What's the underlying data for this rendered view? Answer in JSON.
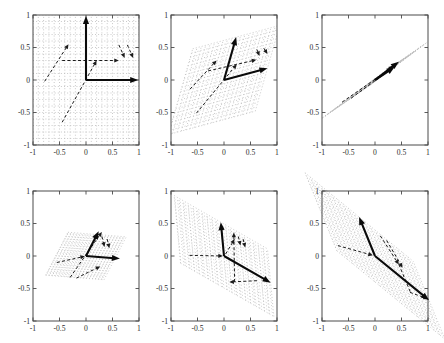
{
  "chart_data": {
    "type": "line",
    "title": "",
    "layout": {
      "rows": 2,
      "cols": 3
    },
    "xlim": [
      -1,
      1
    ],
    "ylim": [
      -1,
      1
    ],
    "grid": "dotted transformed lattice, spacing 0.1",
    "x_tick_labels": [
      "-1",
      "-0.5",
      "0",
      "0.5",
      "1"
    ],
    "y_tick_labels": [
      "-1",
      "-0.5",
      "0",
      "0.5",
      "1"
    ],
    "tick_values": [
      -1,
      -0.5,
      0,
      0.5,
      1
    ],
    "colors": {
      "axis": "#4a4a4a",
      "label": "#2a2a2a",
      "solid_vector": "#0a0a0a",
      "dashed_vector": "#1c1c1c",
      "grid_dots": "#bcbcbc",
      "background": "#ffffff"
    },
    "panels": [
      {
        "name": "identity-grid",
        "position": [
          11,
          7
        ],
        "grid_basis": [
          [
            1,
            0
          ],
          [
            0,
            1
          ]
        ],
        "grid_range": 1,
        "clip": true,
        "solid_vectors": [
          {
            "from": [
              0,
              0
            ],
            "to": [
              0,
              0.985
            ]
          },
          {
            "from": [
              0,
              0
            ],
            "to": [
              0.985,
              0
            ]
          }
        ],
        "dashed_vectors": [
          {
            "from": [
              -0.45,
              0.3
            ],
            "to": [
              0.62,
              0.3
            ],
            "arrow": true
          },
          {
            "from": [
              -0.45,
              -0.65
            ],
            "to": [
              0.2,
              0.3
            ],
            "arrow": true
          },
          {
            "from": [
              -0.78,
              -0.02
            ],
            "to": [
              -0.33,
              0.55
            ],
            "arrow": true
          },
          {
            "from": [
              0.62,
              0.54
            ],
            "to": [
              0.73,
              0.34
            ],
            "arrow": true
          },
          {
            "from": [
              0.78,
              0.54
            ],
            "to": [
              0.89,
              0.34
            ],
            "arrow": true
          }
        ]
      },
      {
        "name": "sheared-grid",
        "position": [
          149,
          7
        ],
        "grid_basis": [
          [
            0.82,
            0.18
          ],
          [
            0.23,
            0.66
          ]
        ],
        "grid_range": 1,
        "clip": true,
        "solid_vectors": [
          {
            "from": [
              0,
              0
            ],
            "to": [
              0.23,
              0.66
            ]
          },
          {
            "from": [
              0,
              0
            ],
            "to": [
              0.82,
              0.18
            ]
          }
        ],
        "dashed_vectors": [
          {
            "from": [
              -0.3,
              0.14
            ],
            "to": [
              0.61,
              0.31
            ],
            "arrow": true
          },
          {
            "from": [
              -0.52,
              -0.51
            ],
            "to": [
              0.24,
              0.24
            ],
            "arrow": true
          },
          {
            "from": [
              -0.64,
              -0.14
            ],
            "to": [
              -0.14,
              0.3
            ],
            "arrow": true
          },
          {
            "from": [
              0.62,
              0.47
            ],
            "to": [
              0.67,
              0.37
            ],
            "arrow": true
          },
          {
            "from": [
              0.75,
              0.49
            ],
            "to": [
              0.82,
              0.4
            ],
            "arrow": true
          }
        ]
      },
      {
        "name": "collapsed-grid",
        "position": [
          300,
          7
        ],
        "grid_basis": [
          [
            0.49,
            0.3
          ],
          [
            0.41,
            0.23
          ]
        ],
        "grid_range": 1.1,
        "clip": true,
        "solid_vectors": [
          {
            "from": [
              0,
              0
            ],
            "to": [
              0.45,
              0.28
            ]
          },
          {
            "from": [
              0,
              0
            ],
            "to": [
              0.37,
              0.2
            ]
          }
        ],
        "dashed_vectors": [
          {
            "from": [
              -0.62,
              -0.34
            ],
            "to": [
              0.3,
              0.18
            ],
            "arrow": false
          },
          {
            "from": [
              -0.45,
              -0.28
            ],
            "to": [
              0.22,
              0.12
            ],
            "arrow": false
          },
          {
            "from": [
              0.05,
              0.03
            ],
            "to": [
              0.34,
              0.22
            ],
            "arrow": true
          }
        ]
      },
      {
        "name": "flattened-grid",
        "position": [
          11,
          183
        ],
        "grid_basis": [
          [
            0.55,
            -0.035
          ],
          [
            0.21,
            0.33
          ]
        ],
        "grid_range": 1,
        "clip": true,
        "solid_vectors": [
          {
            "from": [
              0,
              0
            ],
            "to": [
              0.24,
              0.38
            ]
          },
          {
            "from": [
              0,
              0
            ],
            "to": [
              0.64,
              -0.04
            ]
          }
        ],
        "dashed_vectors": [
          {
            "from": [
              -0.55,
              -0.1
            ],
            "to": [
              -0.02,
              -0.005
            ],
            "arrow": true
          },
          {
            "from": [
              -0.3,
              -0.33
            ],
            "to": [
              0.3,
              0.37
            ],
            "arrow": true
          },
          {
            "from": [
              0.3,
              0.3
            ],
            "to": [
              0.35,
              0.14
            ],
            "arrow": true
          },
          {
            "from": [
              0.4,
              0.26
            ],
            "to": [
              0.44,
              0.12
            ],
            "arrow": true
          },
          {
            "from": [
              -0.18,
              -0.34
            ],
            "to": [
              0.27,
              -0.16
            ],
            "arrow": true
          }
        ]
      },
      {
        "name": "negative-shear-grid",
        "position": [
          149,
          183
        ],
        "grid_basis": [
          [
            0.88,
            -0.41
          ],
          [
            -0.06,
            0.52
          ]
        ],
        "grid_range": 1,
        "clip": true,
        "solid_vectors": [
          {
            "from": [
              0,
              0
            ],
            "to": [
              -0.06,
              0.52
            ]
          },
          {
            "from": [
              0,
              0
            ],
            "to": [
              0.88,
              -0.41
            ]
          }
        ],
        "dashed_vectors": [
          {
            "from": [
              -0.65,
              0.01
            ],
            "to": [
              -0.02,
              0.0
            ],
            "arrow": true
          },
          {
            "from": [
              0.2,
              -0.4
            ],
            "to": [
              0.185,
              0.36
            ],
            "arrow": true
          },
          {
            "from": [
              0.62,
              -0.38
            ],
            "to": [
              0.1,
              -0.4
            ],
            "arrow": true
          },
          {
            "from": [
              0.03,
              0.03
            ],
            "to": [
              0.2,
              0.26
            ],
            "arrow": true
          },
          {
            "from": [
              0.27,
              0.3
            ],
            "to": [
              0.31,
              0.16
            ],
            "arrow": true
          },
          {
            "from": [
              0.36,
              0.26
            ],
            "to": [
              0.4,
              0.13
            ],
            "arrow": true
          }
        ]
      },
      {
        "name": "stretched-diagonal-grid",
        "position": [
          300,
          183
        ],
        "grid_basis": [
          [
            1.02,
            -0.68
          ],
          [
            -0.3,
            0.6
          ]
        ],
        "grid_range": 1,
        "clip": false,
        "solid_vectors": [
          {
            "from": [
              0,
              0
            ],
            "to": [
              -0.3,
              0.6
            ]
          },
          {
            "from": [
              0,
              0
            ],
            "to": [
              1.02,
              -0.68
            ]
          }
        ],
        "dashed_vectors": [
          {
            "from": [
              -0.7,
              0.16
            ],
            "to": [
              -0.04,
              0.01
            ],
            "arrow": true
          },
          {
            "from": [
              0.1,
              0.31
            ],
            "to": [
              0.45,
              -0.13
            ],
            "arrow": true
          },
          {
            "from": [
              0.22,
              0.24
            ],
            "to": [
              0.52,
              -0.18
            ],
            "arrow": true
          },
          {
            "from": [
              0.45,
              -0.13
            ],
            "to": [
              0.68,
              -0.58
            ],
            "arrow": false
          },
          {
            "from": [
              0.66,
              -0.56
            ],
            "to": [
              1.0,
              -0.66
            ],
            "arrow": true
          }
        ]
      }
    ]
  }
}
